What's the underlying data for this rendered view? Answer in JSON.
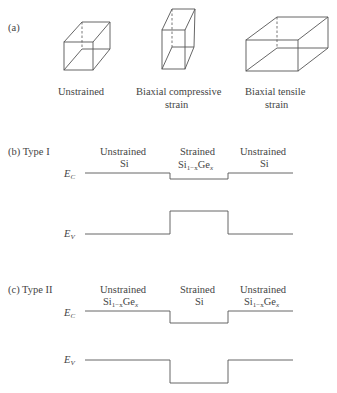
{
  "panel_a": {
    "label": "(a)",
    "boxes": [
      {
        "caption_line1": "Unstrained",
        "caption_line2": ""
      },
      {
        "caption_line1": "Biaxial compressive",
        "caption_line2": "strain"
      },
      {
        "caption_line1": "Biaxial tensile",
        "caption_line2": "strain"
      }
    ]
  },
  "panel_b": {
    "label": "(b) Type I",
    "regions": [
      {
        "line1": "Unstrained",
        "line2": "Si"
      },
      {
        "line1": "Strained",
        "line2_base": "Si",
        "line2_sub1": "1−x",
        "line2_mid": "Ge",
        "line2_sub2": "x"
      },
      {
        "line1": "Unstrained",
        "line2": "Si"
      }
    ],
    "ec_label": "E",
    "ec_sub": "C",
    "ev_label": "E",
    "ev_sub": "V"
  },
  "panel_c": {
    "label": "(c) Type II",
    "regions": [
      {
        "line1": "Unstrained",
        "line2_base": "Si",
        "line2_sub1": "1−x",
        "line2_mid": "Ge",
        "line2_sub2": "x"
      },
      {
        "line1": "Strained",
        "line2": "Si"
      },
      {
        "line1": "Unstrained",
        "line2_base": "Si",
        "line2_sub1": "1−x",
        "line2_mid": "Ge",
        "line2_sub2": "x"
      }
    ],
    "ec_label": "E",
    "ec_sub": "C",
    "ev_label": "E",
    "ev_sub": "V"
  }
}
